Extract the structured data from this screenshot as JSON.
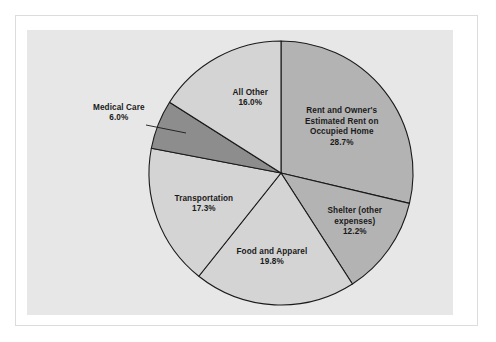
{
  "figure": {
    "panel_color": "#e7e7e7",
    "frame_color": "#dcdcdc",
    "background_color": "#ffffff"
  },
  "chart_data": {
    "type": "pie",
    "title": "",
    "subtitle": "",
    "xlabel": "",
    "ylabel": "",
    "grid": false,
    "legend_position": "none",
    "label_format": "name + percent",
    "start_angle_deg": 0,
    "direction": "clockwise",
    "center": {
      "x": 281,
      "y": 173
    },
    "radius": 132,
    "categories": [
      "Rent and Owner's Estimated Rent on Occupied Home",
      "Shelter (other expenses)",
      "Food and Apparel",
      "Transportation",
      "Medical Care",
      "All Other"
    ],
    "values": [
      28.7,
      12.2,
      19.8,
      17.3,
      6.0,
      16.0
    ],
    "slices": [
      {
        "name": "Rent and Owner's Estimated Rent on Occupied Home",
        "label_lines": [
          "Rent and Owner's",
          "Estimated Rent on",
          "Occupied Home"
        ],
        "value": 28.7,
        "percent_text": "28.7%",
        "color": "#b3b3b3",
        "label_placement": "inside"
      },
      {
        "name": "Shelter (other expenses)",
        "label_lines": [
          "Shelter (other",
          "expenses)"
        ],
        "value": 12.2,
        "percent_text": "12.2%",
        "color": "#b3b3b3",
        "label_placement": "inside"
      },
      {
        "name": "Food and Apparel",
        "label_lines": [
          "Food and Apparel"
        ],
        "value": 19.8,
        "percent_text": "19.8%",
        "color": "#d4d4d4",
        "label_placement": "inside"
      },
      {
        "name": "Transportation",
        "label_lines": [
          "Transportation"
        ],
        "value": 17.3,
        "percent_text": "17.3%",
        "color": "#d4d4d4",
        "label_placement": "inside"
      },
      {
        "name": "Medical Care",
        "label_lines": [
          "Medical Care"
        ],
        "value": 6.0,
        "percent_text": "6.0%",
        "color": "#8d8d8d",
        "label_placement": "outside-callout"
      },
      {
        "name": "All Other",
        "label_lines": [
          "All Other"
        ],
        "value": 16.0,
        "percent_text": "16.0%",
        "color": "#d4d4d4",
        "label_placement": "inside"
      }
    ]
  }
}
